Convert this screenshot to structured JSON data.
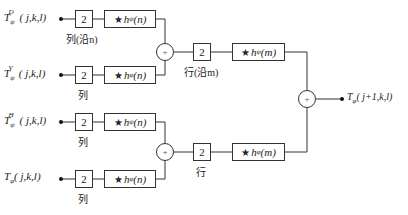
{
  "inputs": [
    {
      "symbol": "T",
      "sub": "ψ",
      "sup": "D",
      "args": "( j,k,l)"
    },
    {
      "symbol": "T",
      "sub": "ψ",
      "sup": "V",
      "args": "( j,k,l)"
    },
    {
      "symbol": "T",
      "sub": "ψ",
      "sup": "H",
      "args": "( j,k,l)"
    },
    {
      "symbol": "T",
      "sub": "φ",
      "sup": "",
      "args": "( j,k,l)"
    }
  ],
  "downsample_label": "2",
  "stage1": {
    "filters": [
      {
        "star": "★",
        "h": "h",
        "sub": "ψ",
        "arg": "(n)"
      },
      {
        "star": "★",
        "h": "h",
        "sub": "φ",
        "arg": "(n)"
      },
      {
        "star": "★",
        "h": "h",
        "sub": "ψ",
        "arg": "(n)"
      },
      {
        "star": "★",
        "h": "h",
        "sub": "φ",
        "arg": "(n)"
      }
    ],
    "labels": [
      "列(沿n)",
      "列",
      "列",
      "列"
    ]
  },
  "stage2": {
    "filters": [
      {
        "star": "★",
        "h": "h",
        "sub": "ψ",
        "arg": "(m)"
      },
      {
        "star": "★",
        "h": "h",
        "sub": "φ",
        "arg": "(m)"
      }
    ],
    "labels": [
      "行(沿m)",
      "行"
    ]
  },
  "sum_symbol": "+",
  "output": {
    "symbol": "T",
    "sub": "φ",
    "args": "( j+1,k,l)"
  }
}
